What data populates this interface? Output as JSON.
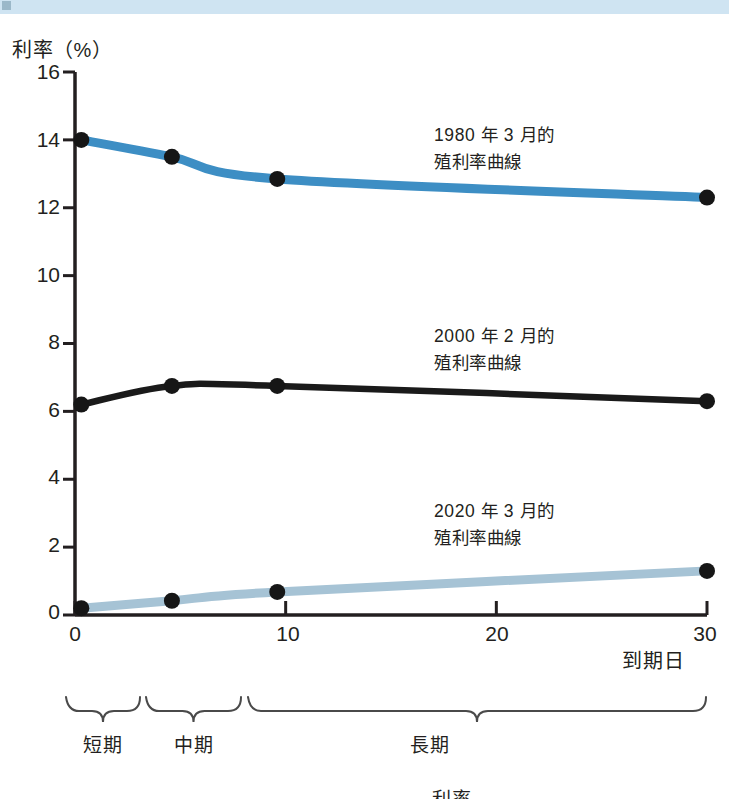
{
  "banner": {
    "text": "",
    "color": "#cfe4f2"
  },
  "chart_data": {
    "type": "line",
    "title": "",
    "ylabel": "利率（%）",
    "xlabel": "到期日",
    "xlim": [
      0,
      30
    ],
    "ylim": [
      0,
      16
    ],
    "yticks": [
      0,
      2,
      4,
      6,
      8,
      10,
      12,
      14,
      16
    ],
    "ytick_labels": [
      "0",
      "2",
      "4",
      "6",
      "8",
      "10",
      "12",
      "14",
      "16"
    ],
    "xticks": [
      0,
      10,
      20,
      30
    ],
    "xtick_labels": [
      "0",
      "10",
      "20",
      "30"
    ],
    "grid": false,
    "legend_position": "inline-annotation",
    "series": [
      {
        "name": "1980 年 3 月的殖利率曲線",
        "label_line1": "1980 年 3 月的",
        "label_line2": "殖利率曲線",
        "color": "#3d8ec4",
        "x": [
          0.3,
          4.6,
          9.6,
          30.0
        ],
        "values": [
          14.0,
          13.5,
          12.85,
          12.3
        ]
      },
      {
        "name": "2000 年 2 月的殖利率曲線",
        "label_line1": "2000 年 2 月的",
        "label_line2": "殖利率曲線",
        "color": "#1a1a1a",
        "x": [
          0.3,
          4.6,
          9.6,
          30.0
        ],
        "values": [
          6.2,
          6.75,
          6.75,
          6.3
        ]
      },
      {
        "name": "2020 年 3 月的殖利率曲線",
        "label_line1": "2020 年 3 月的",
        "label_line2": "殖利率曲線",
        "color": "#a6c3d5",
        "x": [
          0.3,
          4.6,
          9.6,
          30.0
        ],
        "values": [
          0.2,
          0.42,
          0.68,
          1.3
        ]
      }
    ],
    "annotations": [
      {
        "text": "1980 年 3 月的 殖利率曲線",
        "x": 16,
        "y": 14.3
      },
      {
        "text": "2000 年 2 月的 殖利率曲線",
        "x": 16,
        "y": 8.3
      },
      {
        "text": "2020 年 3 月的 殖利率曲線",
        "x": 16,
        "y": 3.0
      }
    ],
    "term_brackets": [
      {
        "label": "短期",
        "x_start": 0,
        "x_end": 3
      },
      {
        "label": "中期",
        "x_start": 3.2,
        "x_end": 8
      },
      {
        "label": "長期",
        "x_start": 8.2,
        "x_end": 30
      }
    ]
  },
  "footer": {
    "cut_text": "利率"
  }
}
